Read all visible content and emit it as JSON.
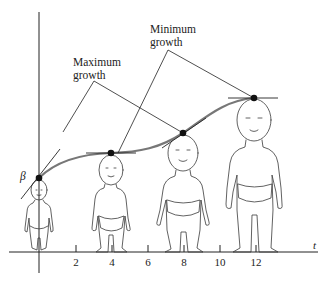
{
  "figure": {
    "axis_labels": {
      "t": "t",
      "beta": "β"
    },
    "ticks": [
      {
        "label": "2",
        "x": 76
      },
      {
        "label": "4",
        "x": 112
      },
      {
        "label": "6",
        "x": 148
      },
      {
        "label": "8",
        "x": 184
      },
      {
        "label": "10",
        "x": 220
      },
      {
        "label": "12",
        "x": 256
      }
    ],
    "annotations": {
      "maximum": {
        "line1": "Maximum",
        "line2": "growth"
      },
      "minimum": {
        "line1": "Minimum",
        "line2": "growth"
      }
    },
    "points": [
      {
        "name": "beta-point",
        "x": 39,
        "y": 178
      },
      {
        "name": "point-t4",
        "x": 111,
        "y": 153
      },
      {
        "name": "point-t8",
        "x": 183,
        "y": 133
      },
      {
        "name": "point-t12",
        "x": 254,
        "y": 98
      }
    ],
    "colors": {
      "curve": "#777777",
      "ink": "#222222",
      "baby": "#3a3a3a"
    }
  }
}
